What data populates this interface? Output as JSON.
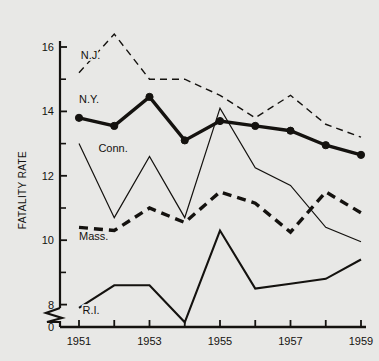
{
  "figure": {
    "background_color": "#e8e8e6",
    "ink_color": "#14120f",
    "width": 379,
    "height": 361
  },
  "axis": {
    "y_title": "FATALITY RATE",
    "y_ticks_major": [
      "16",
      "14",
      "12",
      "10",
      "8"
    ],
    "y_zero_label": "0",
    "y_break": true,
    "x_ticks_major": [
      "1951",
      "1953",
      "1955",
      "1957",
      "1959"
    ]
  },
  "chart_data": {
    "type": "line",
    "title": "",
    "xlabel": "",
    "ylabel": "FATALITY RATE",
    "x": [
      1951,
      1952,
      1953,
      1954,
      1955,
      1956,
      1957,
      1958,
      1959
    ],
    "xlim": [
      1951,
      1959
    ],
    "ylim": [
      7.0,
      16.6
    ],
    "y_axis_break_below": 7.0,
    "y_ticks_major": [
      8,
      10,
      12,
      14,
      16
    ],
    "y_ticks_minor": [
      9,
      11,
      13,
      15
    ],
    "x_ticks_major": [
      1951,
      1953,
      1955,
      1957,
      1959
    ],
    "x_ticks_minor": [
      1952,
      1954,
      1956,
      1958
    ],
    "grid": false,
    "legend": "inline-labels",
    "series": [
      {
        "name": "N.J.",
        "label": "N.J.",
        "style": "thin-dashed",
        "markers": false,
        "color": "#14120f",
        "label_x": 1951.05,
        "label_y": 15.62,
        "values": [
          15.2,
          16.4,
          15.0,
          15.0,
          14.5,
          13.8,
          14.5,
          13.6,
          13.2
        ]
      },
      {
        "name": "N.Y.",
        "label": "N.Y.",
        "style": "thick-solid",
        "markers": true,
        "color": "#14120f",
        "label_x": 1951.0,
        "label_y": 14.25,
        "values": [
          13.8,
          13.55,
          14.45,
          13.1,
          13.7,
          13.55,
          13.4,
          12.95,
          12.65
        ]
      },
      {
        "name": "Conn.",
        "label": "Conn.",
        "style": "thin-solid",
        "markers": false,
        "color": "#14120f",
        "label_x": 1951.55,
        "label_y": 12.75,
        "values": [
          13.0,
          10.7,
          12.6,
          10.7,
          14.1,
          12.25,
          11.7,
          10.4,
          9.95
        ]
      },
      {
        "name": "Mass.",
        "label": "Mass.",
        "style": "thick-dashed",
        "markers": false,
        "color": "#14120f",
        "label_x": 1951.0,
        "label_y": 10.0,
        "values": [
          10.4,
          10.3,
          11.0,
          10.55,
          11.5,
          11.15,
          10.25,
          11.5,
          10.85
        ]
      },
      {
        "name": "R.I.",
        "label": "R.I.",
        "style": "medium-solid",
        "markers": false,
        "color": "#14120f",
        "label_x": 1951.1,
        "label_y": 7.72,
        "values": [
          7.9,
          8.6,
          8.6,
          7.45,
          10.3,
          8.5,
          8.65,
          8.8,
          9.4
        ]
      }
    ]
  }
}
